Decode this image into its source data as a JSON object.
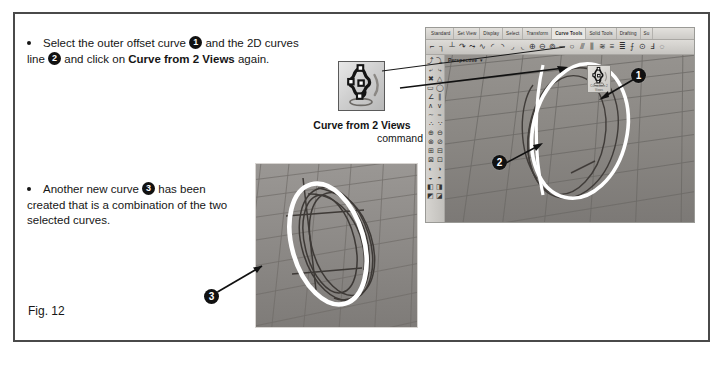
{
  "figure": {
    "caption": "Fig. 12"
  },
  "instructions": [
    {
      "id": "step-select",
      "bullet": "•",
      "segments": [
        {
          "text": "Select the outer offset curve ",
          "style": "normal"
        },
        {
          "text": "1",
          "style": "marker"
        },
        {
          "text": " and the 2D curves line ",
          "style": "normal"
        },
        {
          "text": "2",
          "style": "marker"
        },
        {
          "text": " and click on ",
          "style": "normal"
        },
        {
          "text": "Curve from 2 Views",
          "style": "bold"
        },
        {
          "text": " again.",
          "style": "normal"
        }
      ],
      "plain": "Select the outer offset curve 1 and the 2D curves line 2 and click on Curve from 2 Views again."
    },
    {
      "id": "step-result",
      "bullet": "•",
      "segments": [
        {
          "text": "Another new curve ",
          "style": "normal"
        },
        {
          "text": "3",
          "style": "marker"
        },
        {
          "text": " has been created that is a combination of the two selected curves.",
          "style": "normal"
        }
      ],
      "plain": "Another new curve 3 has been created that is a combination of the two selected curves."
    }
  ],
  "command_callout": {
    "icon_name": "curve-from-2-views-icon",
    "title": "Curve from 2 Views",
    "subtitle": "command"
  },
  "markers": [
    {
      "number": "1",
      "target": "outer offset curve (white ellipse)"
    },
    {
      "number": "2",
      "target": "2D curves line (white vertical curve)"
    },
    {
      "number": "3",
      "target": "new combined curve (white ellipse)"
    }
  ],
  "rhino_window": {
    "tabs": [
      {
        "label": "Standard",
        "active": false
      },
      {
        "label": "Set View",
        "active": false
      },
      {
        "label": "Display",
        "active": false
      },
      {
        "label": "Select",
        "active": false
      },
      {
        "label": "Transform",
        "active": false
      },
      {
        "label": "Curve Tools",
        "active": true
      },
      {
        "label": "Solid Tools",
        "active": false
      },
      {
        "label": "Drafting",
        "active": false
      },
      {
        "label": "Su",
        "active": false
      }
    ],
    "toolbar_glyphs": [
      "⌐",
      "┐",
      "┴",
      "↷",
      "⤳",
      "∿",
      "◜",
      "◝",
      "◞",
      "◟",
      "⊕",
      "⊖",
      "⊚",
      "─",
      "○",
      "⫻",
      "⫼",
      "≋",
      "≡",
      "≣",
      "⨍",
      "⊙",
      "Ⅎ",
      "◌"
    ],
    "sidebar_glyphs": [
      "⤴",
      "⤵",
      "⤶",
      "⤷",
      "✖",
      "△",
      "▭",
      "◯",
      "∠",
      "∥",
      "∧",
      "∨",
      "∼",
      "≈",
      "∴",
      "∵",
      "⊕",
      "⊖",
      "⊗",
      "⊘",
      "⊞",
      "⊟",
      "⊠",
      "⊡",
      "◐",
      "◑",
      "◒",
      "◓",
      "◧",
      "◨",
      "◩",
      "◪"
    ],
    "viewport": {
      "label": "Perspective",
      "dropdown": "▾",
      "background_color": "#8b8884",
      "grid_color": "#6e6b67",
      "selected_curve_color": "#ffffff",
      "unselected_curve_color": "#3e3a37"
    },
    "ghost_icon_label": "Curve from 2 Views"
  },
  "lower_screenshot": {
    "background_color": "#8f8c89",
    "grid_color": "#6e6b67",
    "selected_curve_color": "#ffffff",
    "unselected_curve_color": "#3a3633"
  }
}
